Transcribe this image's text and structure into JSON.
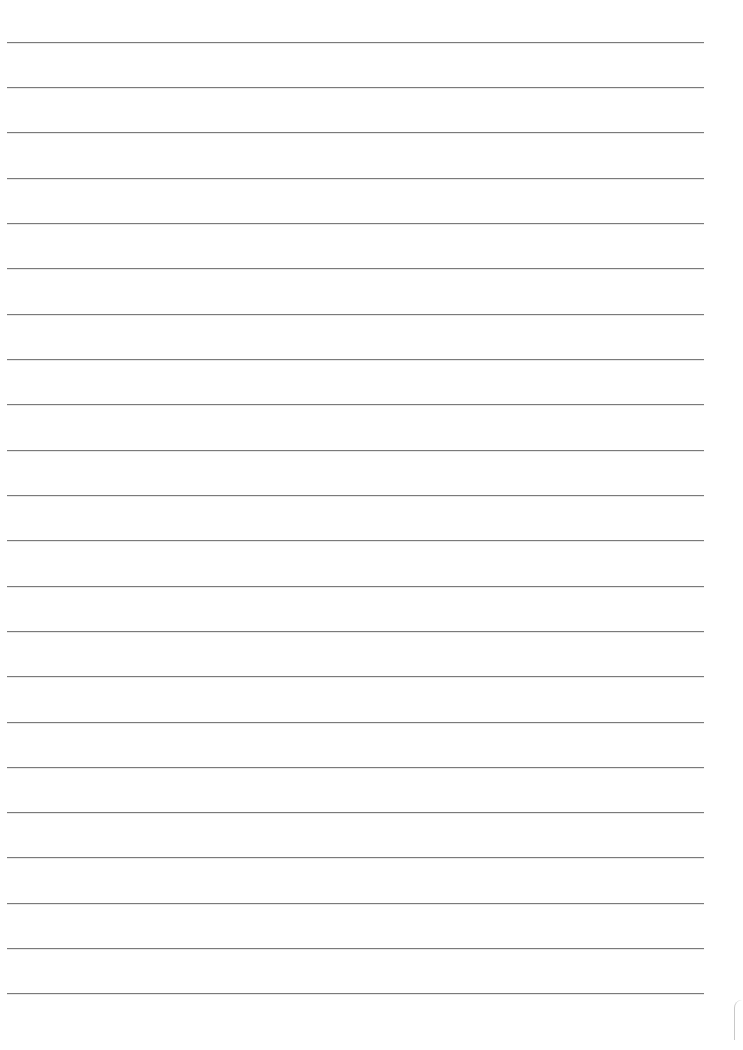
{
  "page": {
    "type": "lined-paper",
    "background_color": "#ffffff",
    "rule_color": "#7a7a7a",
    "rule_count": 22,
    "rules_y": [
      42,
      87,
      132,
      178,
      223,
      268,
      314,
      359,
      404,
      450,
      495,
      540,
      586,
      631,
      676,
      722,
      767,
      812,
      857,
      903,
      948,
      993
    ]
  }
}
